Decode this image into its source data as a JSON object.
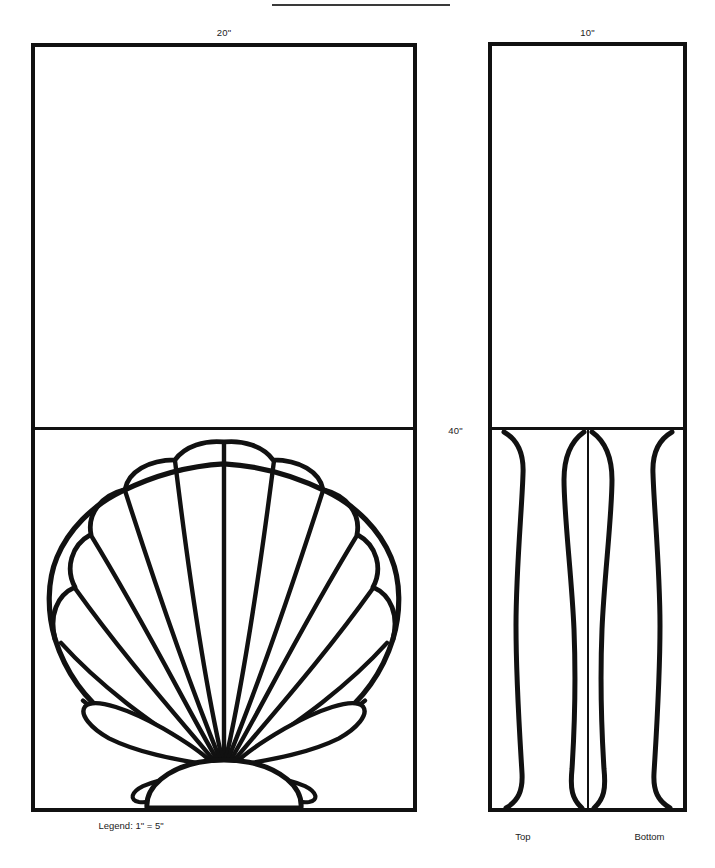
{
  "drawing": {
    "type": "technical-elevation-drawing",
    "subject": "Scallop shell decorative panel",
    "sheet_width_px": 715,
    "sheet_height_px": 868,
    "ink_color": "#111111",
    "paper_color": "#ffffff",
    "top_rule_present": true
  },
  "dimensions": {
    "front_panel_width": "20\"",
    "side_panel_width": "10\"",
    "panel_height": "40\""
  },
  "captions": {
    "legend": "Legend:  1\" = 5\"",
    "side_left": "Top",
    "side_right": "Bottom"
  },
  "panels": [
    {
      "id": "front-elevation",
      "name": "Front elevation panel",
      "width_label": "20\"",
      "height_label": "40\"",
      "upper_section": {
        "content": "blank",
        "fill": "#ffffff"
      },
      "lower_section": {
        "content": "scallop-shell-fan",
        "rib_count": 13,
        "hinge": "dome at bottom centre",
        "outline": "scalloped lobed upper edge"
      }
    },
    {
      "id": "side-elevation",
      "name": "Side elevation panel",
      "width_label": "10\"",
      "height_label": "40\"",
      "upper_section": {
        "content": "blank",
        "fill": "#ffffff"
      },
      "lower_section": {
        "content": "shell-ribs-side-view",
        "centre_rule": true,
        "left_label": "Top",
        "right_label": "Bottom"
      }
    }
  ],
  "shell_art": {
    "rib_count": 13,
    "stroke_color": "#111111",
    "fill_color": "#ffffff",
    "hinge_center_x_pct": 50,
    "hinge_center_y_pct": 88
  }
}
